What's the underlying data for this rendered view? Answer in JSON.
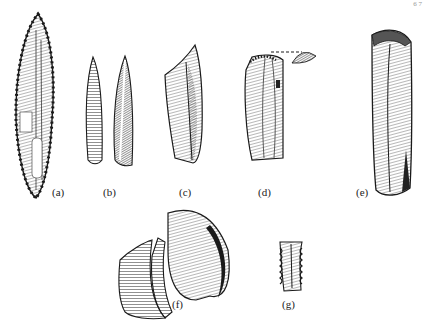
{
  "figure": {
    "page_marker": "6  7",
    "labels": [
      {
        "id": "a",
        "text": "(a)"
      },
      {
        "id": "b",
        "text": "(b)"
      },
      {
        "id": "c",
        "text": "(c)"
      },
      {
        "id": "d",
        "text": "(d)"
      },
      {
        "id": "e",
        "text": "(e)"
      },
      {
        "id": "f",
        "text": "(f)"
      },
      {
        "id": "g",
        "text": "(g)"
      }
    ],
    "items": [
      {
        "id": "a",
        "description": "long leaf-shaped retouched blade point"
      },
      {
        "id": "b",
        "description": "narrow pointed blade, two views"
      },
      {
        "id": "c",
        "description": "blade fragment with pointed tip"
      },
      {
        "id": "d",
        "description": "blade with platform and detached butt view"
      },
      {
        "id": "e",
        "description": "long prismatic blade"
      },
      {
        "id": "f",
        "description": "flake with refitted fragment"
      },
      {
        "id": "g",
        "description": "small notched/denticulated blade segment"
      }
    ],
    "colors": {
      "ink": "#1a1a1a",
      "paper": "#ffffff",
      "shade": "#888888"
    }
  }
}
